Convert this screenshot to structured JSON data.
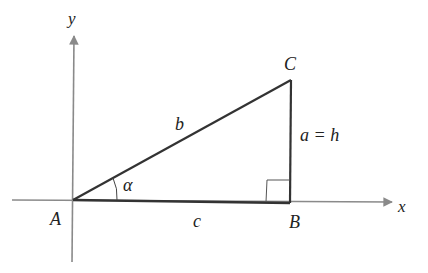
{
  "diagram": {
    "type": "right-triangle-on-axes",
    "axes": {
      "x_label": "x",
      "y_label": "y"
    },
    "vertices": {
      "A": "A",
      "B": "B",
      "C": "C"
    },
    "sides": {
      "b": "b",
      "c": "c",
      "a": "a = h"
    },
    "angle": "α",
    "right_angle_at": "B",
    "colors": {
      "axis": "#8a8a8a",
      "triangle": "#333333",
      "text": "#222222"
    }
  }
}
